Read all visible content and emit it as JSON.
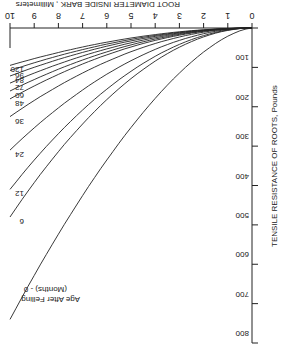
{
  "chart_data": {
    "type": "line",
    "title": "",
    "xlabel": "ROOT DIAMETER INSIDE BARK , Millimeters",
    "ylabel": "TENSILE RESISTANCE OF ROOTS, Pounds",
    "xlim": [
      0,
      10
    ],
    "ylim": [
      0,
      800
    ],
    "x_ticks": [
      "0",
      "1",
      "2",
      "3",
      "4",
      "5",
      "6",
      "7",
      "8",
      "9",
      "10"
    ],
    "y_ticks": [
      "0",
      "100",
      "200",
      "300",
      "400",
      "500",
      "600",
      "700",
      "800"
    ],
    "legend_title": "Age After Felling (Months) - 0",
    "rotated_180": true,
    "x": [
      0,
      2,
      4,
      6,
      8,
      10
    ],
    "series": [
      {
        "name": "0",
        "values": [
          0,
          40,
          150,
          320,
          530,
          740
        ]
      },
      {
        "name": "6",
        "values": [
          0,
          20,
          70,
          125,
          180,
          480
        ]
      },
      {
        "name": "12",
        "values": [
          0,
          18,
          60,
          110,
          160,
          410
        ]
      },
      {
        "name": "24",
        "values": [
          0,
          14,
          45,
          80,
          120,
          310
        ]
      },
      {
        "name": "36",
        "values": [
          0,
          10,
          32,
          55,
          80,
          225
        ]
      },
      {
        "name": "48",
        "values": [
          0,
          8,
          25,
          42,
          62,
          180
        ]
      },
      {
        "name": "60",
        "values": [
          0,
          7,
          22,
          36,
          52,
          160
        ]
      },
      {
        "name": "72",
        "values": [
          0,
          6,
          19,
          31,
          45,
          140
        ]
      },
      {
        "name": "84",
        "values": [
          0,
          5,
          16,
          27,
          38,
          122
        ]
      },
      {
        "name": "96",
        "values": [
          0,
          5,
          14,
          24,
          34,
          108
        ]
      },
      {
        "name": "120",
        "values": [
          0,
          4,
          12,
          20,
          28,
          95
        ]
      }
    ]
  }
}
